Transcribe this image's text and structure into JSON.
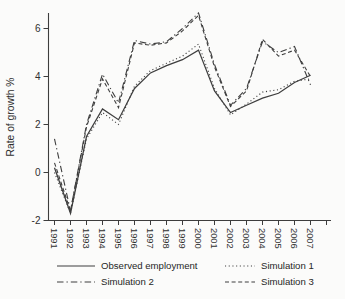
{
  "figure": {
    "ylabel": "Rate of growth %",
    "legend": [
      {
        "label": "Observed employment",
        "style": "solid"
      },
      {
        "label": "Simulation 1",
        "style": "dotted"
      },
      {
        "label": "Simulation 2",
        "style": "dashdot"
      },
      {
        "label": "Simulation 3",
        "style": "dashed"
      }
    ]
  },
  "chart_data": {
    "type": "line",
    "title": "",
    "xlabel": "",
    "ylabel": "Rate of growth %",
    "grid": false,
    "legend_position": "bottom",
    "line_color": "#3e3e3e",
    "background_color": "#fbfbfa",
    "x": [
      1991,
      1992,
      1993,
      1994,
      1995,
      1996,
      1997,
      1998,
      1999,
      2000,
      2001,
      2002,
      2003,
      2004,
      2005,
      2006,
      2007
    ],
    "x_tick_labels": [
      "1991",
      "1992",
      "1993",
      "1994",
      "1995",
      "1996",
      "1997",
      "1998",
      "1999",
      "2000",
      "2001",
      "2002",
      "2003",
      "2004",
      "2005",
      "2006",
      "2007"
    ],
    "y_ticks": [
      -2,
      0,
      2,
      4,
      6
    ],
    "y_tick_labels": [
      "-2",
      "0",
      "2",
      "4",
      "6"
    ],
    "ylim": [
      -2,
      6.9
    ],
    "series": [
      {
        "name": "Observed employment",
        "style": "solid",
        "values": [
          0.2,
          -1.7,
          1.5,
          2.65,
          2.2,
          3.5,
          4.15,
          4.45,
          4.7,
          5.1,
          3.4,
          2.5,
          2.8,
          3.1,
          3.3,
          3.75,
          4.05
        ]
      },
      {
        "name": "Simulation 1",
        "style": "dotted",
        "values": [
          0.0,
          -1.7,
          1.4,
          2.5,
          2.0,
          3.6,
          4.25,
          4.55,
          4.85,
          5.35,
          3.5,
          2.4,
          2.85,
          3.35,
          3.45,
          3.8,
          3.9
        ]
      },
      {
        "name": "Simulation 2",
        "style": "dashdot",
        "values": [
          1.4,
          -1.6,
          2.0,
          4.1,
          2.9,
          5.5,
          5.35,
          5.45,
          6.0,
          6.65,
          4.5,
          2.8,
          3.5,
          5.45,
          5.0,
          5.25,
          3.65
        ]
      },
      {
        "name": "Simulation 3",
        "style": "dashed",
        "values": [
          0.4,
          -1.6,
          1.9,
          3.9,
          2.7,
          5.4,
          5.3,
          5.4,
          5.9,
          6.55,
          4.4,
          2.75,
          3.4,
          5.55,
          4.85,
          5.1,
          4.0
        ]
      }
    ]
  }
}
